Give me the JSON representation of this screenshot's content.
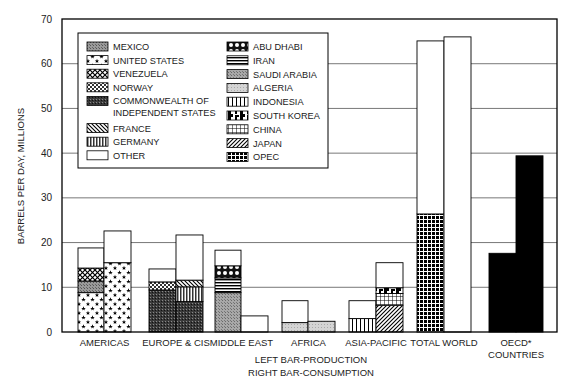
{
  "chart_data": {
    "type": "bar",
    "stacked": true,
    "title": "",
    "xlabel": "",
    "ylabel": "BARRELS PER DAY, MILLIONS",
    "ylim": [
      0,
      70
    ],
    "yticks": [
      0,
      10,
      20,
      30,
      40,
      50,
      60,
      70
    ],
    "grid": true,
    "legend_position": "upper-left-inside",
    "note_lines": [
      "LEFT BAR-PRODUCTION",
      "RIGHT BAR-CONSUMPTION"
    ],
    "categories": [
      "AMERICAS",
      "EUROPE & CIS",
      "MIDDLE EAST",
      "AFRICA",
      "ASIA-PACIFIC",
      "TOTAL WORLD",
      "OECD* COUNTRIES"
    ],
    "category_label_lines": [
      [
        "AMERICAS"
      ],
      [
        "EUROPE & CIS"
      ],
      [
        "MIDDLE EAST"
      ],
      [
        "AFRICA"
      ],
      [
        "ASIA-PACIFIC"
      ],
      [
        "TOTAL WORLD"
      ],
      [
        "OECD*",
        "COUNTRIES"
      ]
    ],
    "legend": [
      {
        "key": "mexico",
        "label": "MEXICO",
        "pattern": "dense-gray"
      },
      {
        "key": "us",
        "label": "UNITED STATES",
        "pattern": "stars"
      },
      {
        "key": "venezuela",
        "label": "VENEZUELA",
        "pattern": "crosshatch-diamond"
      },
      {
        "key": "norway",
        "label": "NORWAY",
        "pattern": "checker"
      },
      {
        "key": "cis",
        "label": "COMMONWEALTH OF INDEPENDENT STATES",
        "label_lines": [
          "COMMONWEALTH OF",
          "INDEPENDENT STATES"
        ],
        "pattern": "dark-dense"
      },
      {
        "key": "france",
        "label": "FRANCE",
        "pattern": "diagonal-back"
      },
      {
        "key": "germany",
        "label": "GERMANY",
        "pattern": "vertical-dense"
      },
      {
        "key": "other",
        "label": "OTHER",
        "pattern": "white"
      },
      {
        "key": "abudhabi",
        "label": "ABU DHABI",
        "pattern": "circles"
      },
      {
        "key": "iran",
        "label": "IRAN",
        "pattern": "horizontal"
      },
      {
        "key": "saudi",
        "label": "SAUDI ARABIA",
        "pattern": "medium-gray"
      },
      {
        "key": "algeria",
        "label": "ALGERIA",
        "pattern": "light-gray"
      },
      {
        "key": "indonesia",
        "label": "INDONESIA",
        "pattern": "vertical-lines"
      },
      {
        "key": "southkorea",
        "label": "SOUTH KOREA",
        "pattern": "blotch"
      },
      {
        "key": "china",
        "label": "CHINA",
        "pattern": "grid"
      },
      {
        "key": "japan",
        "label": "JAPAN",
        "pattern": "diagonal-fwd"
      },
      {
        "key": "opec",
        "label": "OPEC",
        "pattern": "black-grid"
      },
      {
        "key": "oecd",
        "label": "OECD",
        "pattern": "solid-black"
      }
    ],
    "bars": [
      {
        "category": "AMERICAS",
        "side": "production",
        "segments": [
          {
            "key": "us",
            "value": 8.8
          },
          {
            "key": "mexico",
            "value": 2.6
          },
          {
            "key": "venezuela",
            "value": 2.9
          },
          {
            "key": "other",
            "value": 4.5
          }
        ],
        "total": 18.8
      },
      {
        "category": "AMERICAS",
        "side": "consumption",
        "segments": [
          {
            "key": "us",
            "value": 15.5
          },
          {
            "key": "other",
            "value": 7.1
          }
        ],
        "total": 22.6
      },
      {
        "category": "EUROPE & CIS",
        "side": "production",
        "segments": [
          {
            "key": "cis",
            "value": 9.4
          },
          {
            "key": "norway",
            "value": 1.8
          },
          {
            "key": "other",
            "value": 2.9
          }
        ],
        "total": 14.1
      },
      {
        "category": "EUROPE & CIS",
        "side": "consumption",
        "segments": [
          {
            "key": "cis",
            "value": 6.8
          },
          {
            "key": "germany",
            "value": 3.3
          },
          {
            "key": "france",
            "value": 1.5
          },
          {
            "key": "other",
            "value": 10.1
          }
        ],
        "total": 21.7
      },
      {
        "category": "MIDDLE EAST",
        "side": "production",
        "segments": [
          {
            "key": "saudi",
            "value": 8.8
          },
          {
            "key": "iran",
            "value": 3.3
          },
          {
            "key": "abudhabi",
            "value": 2.7
          },
          {
            "key": "other",
            "value": 3.5
          }
        ],
        "total": 18.3
      },
      {
        "category": "MIDDLE EAST",
        "side": "consumption",
        "segments": [
          {
            "key": "other",
            "value": 3.6
          }
        ],
        "total": 3.6
      },
      {
        "category": "AFRICA",
        "side": "production",
        "segments": [
          {
            "key": "algeria",
            "value": 2.1
          },
          {
            "key": "other",
            "value": 4.9
          }
        ],
        "total": 7.0
      },
      {
        "category": "AFRICA",
        "side": "consumption",
        "segments": [
          {
            "key": "algeria",
            "value": 2.4
          }
        ],
        "total": 2.4
      },
      {
        "category": "ASIA-PACIFIC",
        "side": "production",
        "segments": [
          {
            "key": "indonesia",
            "value": 3.0
          },
          {
            "key": "other",
            "value": 4.0
          }
        ],
        "total": 7.0
      },
      {
        "category": "ASIA-PACIFIC",
        "side": "consumption",
        "segments": [
          {
            "key": "japan",
            "value": 6.0
          },
          {
            "key": "china",
            "value": 2.6
          },
          {
            "key": "southkorea",
            "value": 1.3
          },
          {
            "key": "other",
            "value": 5.6
          }
        ],
        "total": 15.5
      },
      {
        "category": "TOTAL WORLD",
        "side": "production",
        "segments": [
          {
            "key": "opec",
            "value": 26.4
          },
          {
            "key": "other",
            "value": 38.7
          }
        ],
        "total": 65.1
      },
      {
        "category": "TOTAL WORLD",
        "side": "consumption",
        "segments": [
          {
            "key": "other",
            "value": 66.0
          }
        ],
        "total": 66.0
      },
      {
        "category": "OECD* COUNTRIES",
        "side": "production",
        "segments": [
          {
            "key": "oecd",
            "value": 17.6
          }
        ],
        "total": 17.6
      },
      {
        "category": "OECD* COUNTRIES",
        "side": "consumption",
        "segments": [
          {
            "key": "oecd",
            "value": 39.4
          }
        ],
        "total": 39.4
      }
    ]
  }
}
